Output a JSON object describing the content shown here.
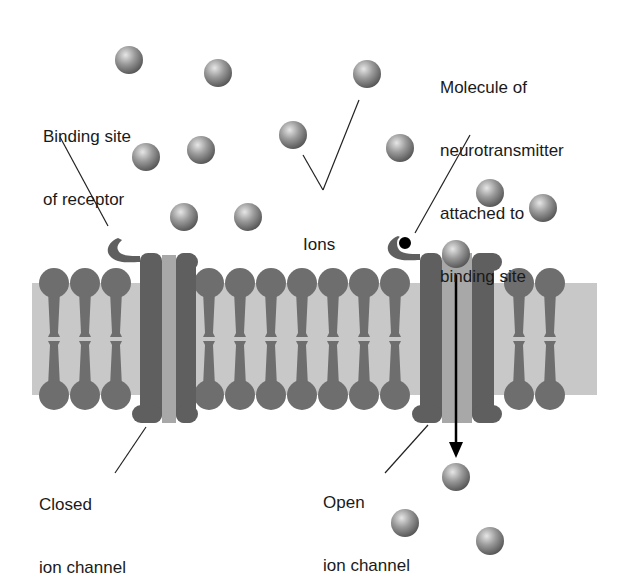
{
  "figure": {
    "labels": {
      "binding_site": [
        "Binding site",
        "of receptor"
      ],
      "ions": "Ions",
      "molecule": [
        "Molecule of",
        "neurotransmitter",
        "attached to",
        "binding site"
      ],
      "closed_channel": [
        "Closed",
        "ion channel"
      ],
      "open_channel": [
        "Open",
        "ion channel"
      ]
    },
    "colors": {
      "lipid_head": "#6e6e6e",
      "lipid_core": "#c8c8c8",
      "protein": "#5f5f5f",
      "pore": "#a8a8a8",
      "ion_light": "#d9d9d9",
      "ion_dark": "#5a5a5a",
      "neurotransmitter": "#000000",
      "arrow": "#000000"
    },
    "ions": [
      {
        "x": 129,
        "y": 60
      },
      {
        "x": 218,
        "y": 73
      },
      {
        "x": 367,
        "y": 74
      },
      {
        "x": 146,
        "y": 157
      },
      {
        "x": 201,
        "y": 150
      },
      {
        "x": 293,
        "y": 135
      },
      {
        "x": 400,
        "y": 148
      },
      {
        "x": 184,
        "y": 217
      },
      {
        "x": 248,
        "y": 217
      },
      {
        "x": 490,
        "y": 193
      },
      {
        "x": 543,
        "y": 208
      },
      {
        "x": 456,
        "y": 254
      },
      {
        "x": 456,
        "y": 477
      },
      {
        "x": 405,
        "y": 523
      },
      {
        "x": 490,
        "y": 541
      }
    ],
    "membrane": {
      "x_start": 38,
      "x_end": 591,
      "top_head_y": 283,
      "bottom_head_y": 395,
      "head_r": 15,
      "spacing": 31
    }
  }
}
